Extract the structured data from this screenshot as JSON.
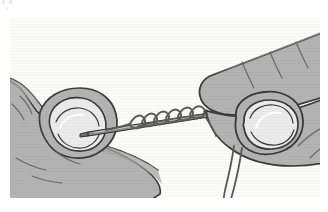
{
  "page": {
    "width": 328,
    "height": 212,
    "background_color": "#ffffff",
    "artifact_marks_label": "scan artifact marks"
  },
  "plate": {
    "x": 10,
    "y": 18,
    "width": 310,
    "height": 180,
    "background_color": "#fbfbfa",
    "style": "grayscale line-art instructional illustration",
    "caption": "",
    "alt_text": "Two hands holding a sewing needle; thread is wrapped in coils around the needle shaft while the left fingertip steadies the needle point and a thread tail hangs down from the right hand."
  },
  "colors": {
    "outline": "#3a3a3a",
    "skin_fill": "#b3b3b3",
    "skin_shadow": "#9a9a9a",
    "nail_fill": "#ebebeb",
    "nail_highlight": "#f7f7f7",
    "needle_fill": "#8c8c8c",
    "needle_outline": "#2f2f2f",
    "thread_stroke": "#5a5a5a",
    "background": "#fbfbfa",
    "crease_line": "#6a6a6a"
  },
  "objects": [
    {
      "name": "left-hand",
      "label": "Left hand",
      "description": "Left index finger and thumb pinching the needle point from the lower left."
    },
    {
      "name": "left-fingernail",
      "label": "Left fingernail",
      "description": "Oval fingernail on the left fingertip."
    },
    {
      "name": "right-hand",
      "label": "Right hand",
      "description": "Right index finger and thumb gripping the needle from the upper right."
    },
    {
      "name": "right-fingernail",
      "label": "Right fingernail",
      "description": "Large rounded fingernail on the right thumb."
    },
    {
      "name": "needle",
      "label": "Sewing needle",
      "description": "Straight needle spanning horizontally between both hands."
    },
    {
      "name": "thread-coils",
      "label": "Thread coils",
      "description": "Thread wrapped in several tight coils around the middle of the needle."
    },
    {
      "name": "thread-tail",
      "label": "Thread tail",
      "description": "Loose thread end hanging down below the right hand."
    },
    {
      "name": "knuckle-creases",
      "label": "Knuckle creases",
      "description": "Short line strokes indicating skin creases on the fingers."
    }
  ]
}
